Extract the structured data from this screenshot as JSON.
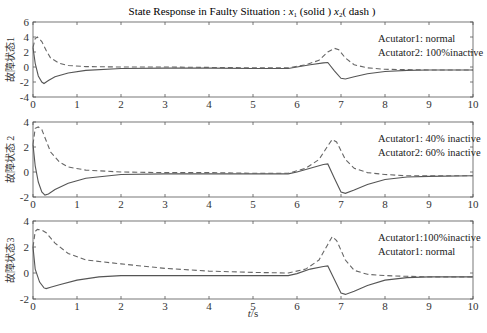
{
  "chart_data": {
    "title": "State Response in Faulty Situation : x1 (solid ) x2( dash )",
    "xlabel": "t/s",
    "panels": [
      {
        "type": "line",
        "ylabel": "故障状态1",
        "xlim": [
          0,
          10
        ],
        "ylim": [
          -4,
          6
        ],
        "xticks": [
          0,
          1,
          2,
          3,
          4,
          5,
          6,
          7,
          8,
          9,
          10
        ],
        "yticks": [
          -4,
          -2,
          0,
          2,
          4,
          6
        ],
        "annotations": [
          "Acutator1: normal",
          "Acutator2: 100%inactive"
        ],
        "series": [
          {
            "name": "x1 (solid)",
            "style": "solid",
            "x": [
              0,
              0.05,
              0.12,
              0.2,
              0.25,
              0.35,
              0.5,
              0.8,
              1.2,
              2,
              3,
              4,
              5,
              5.8,
              6.0,
              6.3,
              6.6,
              6.7,
              6.85,
              7.0,
              7.1,
              7.3,
              7.6,
              8.0,
              8.5,
              9,
              10
            ],
            "y": [
              2.6,
              0.5,
              -1.2,
              -2.0,
              -2.2,
              -1.8,
              -1.3,
              -0.8,
              -0.45,
              -0.2,
              -0.15,
              -0.15,
              -0.2,
              -0.2,
              0.0,
              0.3,
              0.55,
              0.6,
              -0.5,
              -1.5,
              -1.6,
              -1.3,
              -0.9,
              -0.6,
              -0.45,
              -0.4,
              -0.4
            ]
          },
          {
            "name": "x2 (dash)",
            "style": "dash",
            "x": [
              0,
              0.05,
              0.1,
              0.2,
              0.3,
              0.4,
              0.6,
              0.8,
              1.2,
              2,
              3,
              4,
              5,
              5.8,
              6.2,
              6.5,
              6.7,
              6.85,
              6.95,
              7.1,
              7.3,
              7.6,
              8.0,
              8.5,
              9,
              10
            ],
            "y": [
              2.6,
              3.8,
              4.0,
              3.4,
              2.2,
              1.2,
              0.5,
              0.2,
              0.05,
              0.0,
              0.0,
              -0.05,
              -0.1,
              -0.1,
              0.3,
              0.9,
              2.0,
              2.5,
              2.3,
              1.2,
              0.3,
              -0.1,
              -0.3,
              -0.35,
              -0.4,
              -0.4
            ]
          }
        ]
      },
      {
        "type": "line",
        "ylabel": "故障状态 2",
        "xlim": [
          0,
          10
        ],
        "ylim": [
          -2,
          4
        ],
        "xticks": [
          0,
          1,
          2,
          3,
          4,
          5,
          6,
          7,
          8,
          9,
          10
        ],
        "yticks": [
          -2,
          0,
          2,
          4
        ],
        "annotations": [
          "Acutator1: 40% inactive",
          "Acutator2: 60% inactive"
        ],
        "series": [
          {
            "name": "x1 (solid)",
            "style": "solid",
            "x": [
              0,
              0.05,
              0.12,
              0.2,
              0.27,
              0.35,
              0.5,
              0.8,
              1.2,
              2,
              3,
              4,
              5,
              5.8,
              6.0,
              6.3,
              6.6,
              6.7,
              6.85,
              7.0,
              7.1,
              7.3,
              7.6,
              8.0,
              8.5,
              9,
              10
            ],
            "y": [
              2.2,
              0.5,
              -0.8,
              -1.6,
              -1.85,
              -1.75,
              -1.4,
              -0.9,
              -0.5,
              -0.2,
              -0.15,
              -0.15,
              -0.15,
              -0.15,
              0.0,
              0.3,
              0.6,
              0.65,
              -0.5,
              -1.6,
              -1.7,
              -1.45,
              -1.0,
              -0.6,
              -0.4,
              -0.35,
              -0.3
            ]
          },
          {
            "name": "x2 (dash)",
            "style": "dash",
            "x": [
              0,
              0.05,
              0.12,
              0.2,
              0.3,
              0.4,
              0.6,
              0.8,
              1.2,
              2,
              3,
              4,
              5,
              5.8,
              6.2,
              6.5,
              6.7,
              6.8,
              6.9,
              7.1,
              7.3,
              7.6,
              8.0,
              8.5,
              9,
              10
            ],
            "y": [
              2.2,
              3.5,
              3.6,
              3.4,
              2.5,
              1.6,
              0.8,
              0.4,
              0.15,
              0.0,
              -0.05,
              -0.05,
              -0.1,
              -0.1,
              0.3,
              1.0,
              2.1,
              2.6,
              2.4,
              1.0,
              0.3,
              -0.05,
              -0.2,
              -0.3,
              -0.3,
              -0.3
            ]
          }
        ]
      },
      {
        "type": "line",
        "ylabel": "故障状态3",
        "xlim": [
          0,
          10
        ],
        "ylim": [
          -2,
          4
        ],
        "xticks": [
          0,
          1,
          2,
          3,
          4,
          5,
          6,
          7,
          8,
          9,
          10
        ],
        "yticks": [
          -2,
          0,
          2,
          4
        ],
        "annotations": [
          "Acutator1:100%inactive",
          "Acutator1: normal"
        ],
        "series": [
          {
            "name": "x1 (solid)",
            "style": "solid",
            "x": [
              0,
              0.05,
              0.15,
              0.25,
              0.3,
              0.4,
              0.6,
              1.0,
              1.5,
              2,
              3,
              4,
              5,
              5.8,
              6.0,
              6.3,
              6.6,
              6.7,
              6.85,
              7.0,
              7.1,
              7.3,
              7.6,
              8.0,
              8.5,
              9,
              10
            ],
            "y": [
              2.0,
              0.3,
              -0.7,
              -1.15,
              -1.2,
              -1.1,
              -0.9,
              -0.55,
              -0.3,
              -0.2,
              -0.2,
              -0.2,
              -0.2,
              -0.2,
              -0.05,
              0.3,
              0.5,
              0.55,
              -0.5,
              -1.55,
              -1.65,
              -1.4,
              -0.95,
              -0.55,
              -0.35,
              -0.3,
              -0.3
            ]
          },
          {
            "name": "x2 (dash)",
            "style": "dash",
            "x": [
              0,
              0.05,
              0.1,
              0.2,
              0.3,
              0.5,
              0.8,
              1.2,
              2,
              3,
              4,
              5,
              5.8,
              6.2,
              6.5,
              6.7,
              6.8,
              6.9,
              7.1,
              7.3,
              7.6,
              8.0,
              8.5,
              9,
              10
            ],
            "y": [
              2.0,
              3.2,
              3.35,
              3.3,
              3.1,
              2.3,
              1.5,
              1.0,
              0.7,
              0.35,
              0.15,
              0.05,
              0.0,
              0.3,
              1.0,
              2.2,
              2.8,
              2.5,
              1.0,
              0.2,
              -0.1,
              -0.2,
              -0.25,
              -0.3,
              -0.3
            ]
          }
        ]
      }
    ]
  },
  "layout": {
    "x_px": [
      33,
      473
    ],
    "panels_px": [
      {
        "top": 22,
        "bottom": 97
      },
      {
        "top": 122,
        "bottom": 197
      },
      {
        "top": 221,
        "bottom": 299
      }
    ]
  },
  "labels": {
    "title_prefix": "State Response in Faulty Situation : ",
    "x1": "x",
    "x1_sub": "1",
    "solid": " (solid ) ",
    "x2": "x",
    "x2_sub": "2",
    "dash": "( dash )",
    "xlabel_t": "t",
    "xlabel_unit": "/s"
  }
}
